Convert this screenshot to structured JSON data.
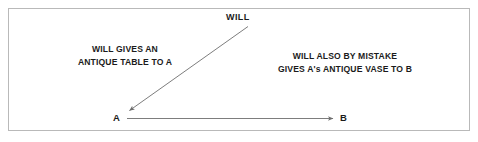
{
  "diagram": {
    "type": "property-transfer-flow",
    "background_color": "#ffffff",
    "border_color": "#b9b9b9",
    "line_color": "#6e6e6e",
    "text_color": "#1b1b1b",
    "nodes": [
      {
        "id": "will",
        "label": "WILL"
      },
      {
        "id": "a",
        "label": "A"
      },
      {
        "id": "b",
        "label": "B"
      }
    ],
    "edges": [
      {
        "id": "will-to-a",
        "from": "will",
        "to": "a",
        "direction": "down-left",
        "caption_lines": [
          "WILL GIVES AN",
          "ANTIQUE TABLE TO A"
        ]
      },
      {
        "id": "a-to-b",
        "from": "a",
        "to": "b",
        "direction": "right",
        "caption_lines": [
          "WILL ALSO BY MISTAKE",
          "GIVES A's ANTIQUE VASE TO B"
        ]
      }
    ],
    "captions": {
      "left": {
        "line1": "WILL GIVES AN",
        "line2": "ANTIQUE TABLE TO A"
      },
      "right": {
        "line1": "WILL ALSO BY MISTAKE",
        "line2": "GIVES A's ANTIQUE VASE TO B"
      }
    }
  }
}
